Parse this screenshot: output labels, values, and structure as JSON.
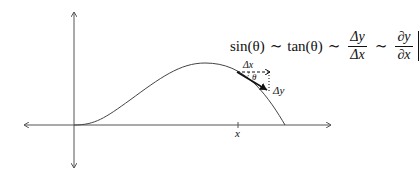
{
  "diagram": {
    "formula": {
      "sin_part": "sin(θ)",
      "sim1": "∼",
      "tan_part": "tan(θ)",
      "sim2": "∼",
      "frac1": {
        "num": "Δy",
        "den": "Δx"
      },
      "sim3": "∼",
      "frac2": {
        "num": "∂y",
        "den": "∂x"
      },
      "eval_subscript": "x"
    },
    "labels": {
      "delta_x": "Δx",
      "theta": "θ",
      "delta_y": "Δy",
      "axis_tick": "x"
    },
    "colors": {
      "axis": "#555555",
      "curve": "#444444",
      "tangent": "#111111",
      "text": "#111111"
    }
  }
}
